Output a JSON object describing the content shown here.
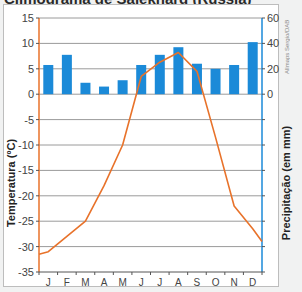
{
  "title": "Climograma de Salekhard (Rússia)",
  "credit": "Allmaps Sergio/DAB",
  "colors": {
    "temperature_line": "#e8722a",
    "precipitation_bar": "#1b8ad8",
    "left_axis": "#e8722a",
    "right_axis": "#1b8ad8",
    "grid": "#9a9a9a"
  },
  "chart_data": {
    "type": "bar+line",
    "title": "",
    "categories": [
      "J",
      "F",
      "M",
      "A",
      "M",
      "J",
      "J",
      "A",
      "S",
      "O",
      "N",
      "D"
    ],
    "series": [
      {
        "name": "Precipitação (em mm)",
        "type": "bar",
        "axis": "right",
        "values": [
          23,
          31,
          9,
          6,
          11,
          23,
          31,
          37,
          24,
          20,
          23,
          41
        ]
      },
      {
        "name": "Temperatura (ºC)",
        "type": "line",
        "axis": "left",
        "values": [
          -31,
          -28,
          -25,
          -18,
          -10,
          3.5,
          6.3,
          8.2,
          4.5,
          -8.5,
          -22,
          -26.5
        ]
      }
    ],
    "ylabel_left": "Temperatura (ºC)",
    "ylabel_right": "Precipitação (em mm)",
    "ylim_left": [
      -35,
      15
    ],
    "yticks_left": [
      15,
      10,
      5,
      0,
      -5,
      -10,
      -15,
      -20,
      -25,
      -30,
      -35
    ],
    "ylim_right": [
      -140,
      60
    ],
    "yticks_right_labeled": [
      60,
      40,
      20,
      0
    ],
    "grid": true,
    "legend": "none"
  },
  "axes": {
    "left_ticks": [
      "15",
      "10",
      "5",
      "0",
      "-5",
      "-10",
      "-15",
      "-20",
      "-25",
      "-30",
      "-35"
    ],
    "right_ticks": [
      "60",
      "40",
      "20",
      "0"
    ],
    "x_ticks": [
      "J",
      "F",
      "M",
      "A",
      "M",
      "J",
      "J",
      "A",
      "S",
      "O",
      "N",
      "D"
    ],
    "left_title": "Temperatura (ºC)",
    "right_title": "Precipitação (em mm)"
  }
}
